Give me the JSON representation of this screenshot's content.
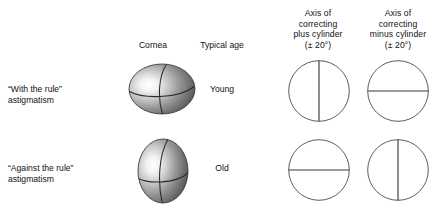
{
  "figure": {
    "background_color": "#ffffff",
    "line_color": "#555555",
    "text_color": "#111111"
  },
  "columns": {
    "row_label": {
      "header": ""
    },
    "cornea": {
      "header": "Cornea"
    },
    "age": {
      "header": "Typical age"
    },
    "plus_cylinder": {
      "header_lines": [
        "Axis of",
        "correcting",
        "plus cylinder",
        "(± 20°)"
      ],
      "line1": "Axis of",
      "line2": "correcting",
      "line3": "plus cylinder",
      "line4": "(± 20°)"
    },
    "minus_cylinder": {
      "header_lines": [
        "Axis of",
        "correcting",
        "minus cylinder",
        "(± 20°)"
      ],
      "line1": "Axis of",
      "line2": "correcting",
      "line3": "minus cylinder",
      "line4": "(± 20°)"
    }
  },
  "rows": [
    {
      "label_line1": "“With the rule”",
      "label_line2": "astigmatism",
      "age": "Young",
      "cornea_shape": "oblate-ellipse-wide",
      "plus_axis": "vertical",
      "minus_axis": "horizontal"
    },
    {
      "label_line1": "“Against the rule”",
      "label_line2": "astigmatism",
      "age": "Old",
      "cornea_shape": "prolate-ellipse-tall",
      "plus_axis": "horizontal",
      "minus_axis": "vertical"
    }
  ]
}
